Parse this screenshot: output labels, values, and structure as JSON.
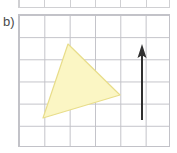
{
  "panel": {
    "label": "b)",
    "width": 177,
    "height": 153
  },
  "grid": {
    "left": 18,
    "top": 14,
    "width": 152,
    "height": 133,
    "columns": 6,
    "rows": 6,
    "cell_width": 25.33,
    "cell_height": 22.17,
    "line_color": "#c2c2c8",
    "border_color": "#c2c2c8",
    "background_color": "#ffffff"
  },
  "top_partial_grid": {
    "left": 18,
    "top": -14,
    "width": 152,
    "height": 22,
    "line_color": "#c8c8cc",
    "description": "cut-off bottom edge of the panel above"
  },
  "chart_data": {
    "type": "scatter",
    "title": "b)",
    "xlabel": "",
    "ylabel": "",
    "grid": true,
    "legend": null,
    "xlim": [
      0,
      6
    ],
    "ylim": [
      0,
      6
    ],
    "shapes": [
      {
        "name": "triangle",
        "kind": "polygon",
        "fill": "#fbf6c4",
        "stroke": "#e8dd8a",
        "stroke_width": 1.2,
        "vertices_px": [
          [
            68,
            44
          ],
          [
            120,
            95
          ],
          [
            43,
            118
          ]
        ],
        "vertices_grid": [
          [
            1.97,
            4.65
          ],
          [
            4.03,
            2.35
          ],
          [
            0.99,
            1.31
          ]
        ]
      },
      {
        "name": "vector-arrow",
        "kind": "arrow",
        "color": "#303030",
        "stroke_width": 2,
        "start_px": [
          142,
          120
        ],
        "end_px": [
          142,
          44
        ],
        "start_grid": [
          4.9,
          1.22
        ],
        "end_grid": [
          4.9,
          4.65
        ],
        "direction": "up",
        "head_length_px": 14,
        "head_width_px": 9
      }
    ]
  },
  "colors": {
    "triangle_fill": "#fbf6c4",
    "triangle_stroke": "#e8dd8a",
    "arrow": "#303030",
    "grid_line": "#c2c2c8",
    "label_text": "#4a4a4a",
    "background": "#ffffff"
  }
}
